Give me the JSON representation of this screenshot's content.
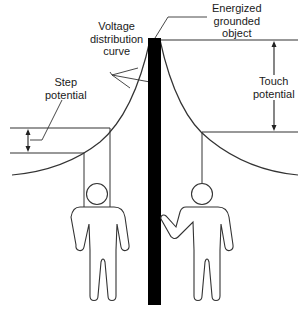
{
  "diagram": {
    "labels": {
      "voltage_curve": [
        "Voltage",
        "distribution",
        "curve"
      ],
      "energized_object": [
        "Energized",
        "grounded",
        "object"
      ],
      "step_potential": [
        "Step",
        "potential"
      ],
      "touch_potential": [
        "Touch",
        "potential"
      ]
    },
    "colors": {
      "line": "#333333",
      "pole": "#000000",
      "background": "#ffffff"
    },
    "elements": {
      "pole": "energized grounded object (black vertical bar)",
      "left_person": "person standing, feet apart – step potential",
      "right_person": "person touching pole – touch potential"
    }
  }
}
